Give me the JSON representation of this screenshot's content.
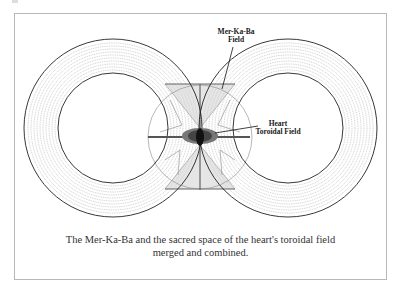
{
  "figure": {
    "labels": {
      "merkaba_line1": "Mer-Ka-Ba",
      "merkaba_line2": "Field",
      "heart_line1": "Heart",
      "heart_line2": "Toroidal Field"
    },
    "caption": {
      "line1": "The Mer-Ka-Ba and the sacred space of the heart's toroidal field",
      "line2": "merged and combined."
    },
    "colors": {
      "stroke": "#222222",
      "fine_lines": "#777777",
      "frame": "#b8b8b8"
    }
  }
}
